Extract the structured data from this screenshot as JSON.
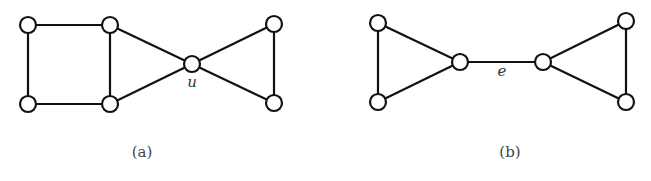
{
  "figure": {
    "subfigures": [
      {
        "id": "a",
        "caption": "(a)",
        "caption_pos": [
          142,
          157
        ],
        "nodes": [
          {
            "id": "a1",
            "x": 28,
            "y": 25
          },
          {
            "id": "a2",
            "x": 110,
            "y": 25
          },
          {
            "id": "a3",
            "x": 28,
            "y": 104
          },
          {
            "id": "a4",
            "x": 110,
            "y": 104
          },
          {
            "id": "u",
            "x": 192,
            "y": 64,
            "label": "u"
          },
          {
            "id": "a6",
            "x": 274,
            "y": 24
          },
          {
            "id": "a7",
            "x": 274,
            "y": 103
          }
        ],
        "edges": [
          [
            "a1",
            "a2"
          ],
          [
            "a1",
            "a3"
          ],
          [
            "a3",
            "a4"
          ],
          [
            "a2",
            "a4"
          ],
          [
            "a2",
            "u"
          ],
          [
            "a4",
            "u"
          ],
          [
            "u",
            "a6"
          ],
          [
            "u",
            "a7"
          ],
          [
            "a6",
            "a7"
          ]
        ],
        "vertex_label": {
          "text": "u",
          "x": 192,
          "y": 87
        }
      },
      {
        "id": "b",
        "caption": "(b)",
        "caption_pos": [
          510,
          157
        ],
        "nodes": [
          {
            "id": "b1",
            "x": 378,
            "y": 23
          },
          {
            "id": "b2",
            "x": 378,
            "y": 102
          },
          {
            "id": "b3",
            "x": 460,
            "y": 62
          },
          {
            "id": "b4",
            "x": 543,
            "y": 62
          },
          {
            "id": "b5",
            "x": 626,
            "y": 21
          },
          {
            "id": "b6",
            "x": 626,
            "y": 102
          }
        ],
        "edges": [
          [
            "b1",
            "b2"
          ],
          [
            "b1",
            "b3"
          ],
          [
            "b2",
            "b3"
          ],
          [
            "b3",
            "b4"
          ],
          [
            "b4",
            "b5"
          ],
          [
            "b4",
            "b6"
          ],
          [
            "b5",
            "b6"
          ]
        ],
        "edge_label": {
          "text": "e",
          "x": 502,
          "y": 76
        }
      }
    ],
    "node_radius": 8
  }
}
